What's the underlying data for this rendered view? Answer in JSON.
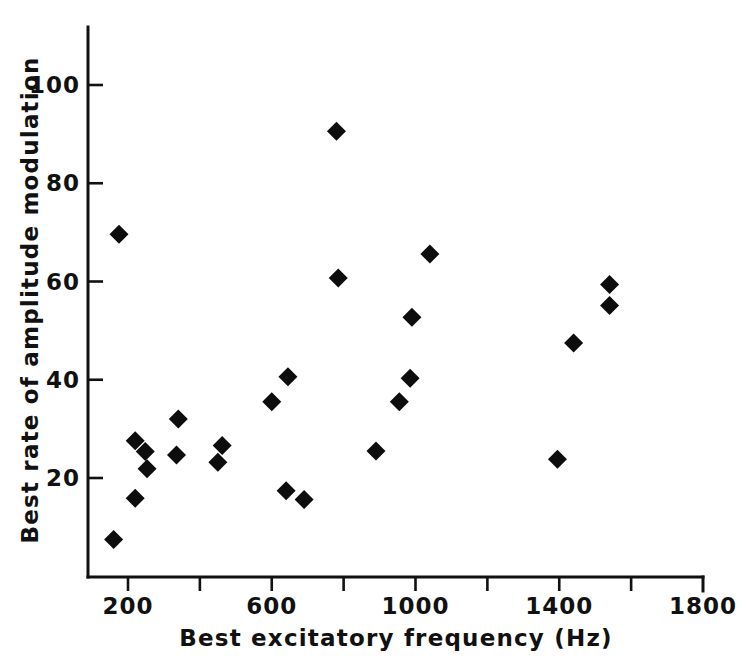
{
  "chart_data": {
    "type": "scatter",
    "title": "",
    "subtitle": "",
    "xlabel": "Best excitatory frequency  (Hz)",
    "ylabel": "Best rate of amplitude modulation",
    "xlim": [
      120,
      1800
    ],
    "ylim": [
      0,
      108
    ],
    "grid": false,
    "legend": null,
    "annotations": [],
    "xticks": [
      {
        "value": 200,
        "label": "200"
      },
      {
        "value": 400,
        "label": ""
      },
      {
        "value": 600,
        "label": "600"
      },
      {
        "value": 800,
        "label": ""
      },
      {
        "value": 1000,
        "label": "1000"
      },
      {
        "value": 1200,
        "label": ""
      },
      {
        "value": 1400,
        "label": "1400"
      },
      {
        "value": 1600,
        "label": ""
      },
      {
        "value": 1800,
        "label": "1800"
      }
    ],
    "yticks": [
      {
        "value": 20,
        "label": "20"
      },
      {
        "value": 40,
        "label": "40"
      },
      {
        "value": 60,
        "label": "60"
      },
      {
        "value": 80,
        "label": "80"
      },
      {
        "value": 100,
        "label": "100"
      }
    ],
    "marker": {
      "shape": "diamond",
      "color": "#0d0d0d",
      "size": 19
    },
    "points": [
      {
        "x": 175,
        "y": 69.6
      },
      {
        "x": 160,
        "y": 7.5
      },
      {
        "x": 220,
        "y": 15.9
      },
      {
        "x": 220,
        "y": 27.6
      },
      {
        "x": 248,
        "y": 25.4
      },
      {
        "x": 253,
        "y": 21.9
      },
      {
        "x": 340,
        "y": 32.0
      },
      {
        "x": 335,
        "y": 24.7
      },
      {
        "x": 450,
        "y": 23.2
      },
      {
        "x": 462,
        "y": 26.6
      },
      {
        "x": 600,
        "y": 35.5
      },
      {
        "x": 640,
        "y": 17.4
      },
      {
        "x": 690,
        "y": 15.6
      },
      {
        "x": 645,
        "y": 40.6
      },
      {
        "x": 780,
        "y": 90.6
      },
      {
        "x": 785,
        "y": 60.7
      },
      {
        "x": 890,
        "y": 25.5
      },
      {
        "x": 955,
        "y": 35.5
      },
      {
        "x": 985,
        "y": 40.3
      },
      {
        "x": 990,
        "y": 52.7
      },
      {
        "x": 1040,
        "y": 65.6
      },
      {
        "x": 1395,
        "y": 23.8
      },
      {
        "x": 1440,
        "y": 47.5
      },
      {
        "x": 1540,
        "y": 59.4
      },
      {
        "x": 1540,
        "y": 55.1
      }
    ]
  },
  "axes": {
    "x_axis_name": "x-axis",
    "y_axis_name": "y-axis"
  }
}
